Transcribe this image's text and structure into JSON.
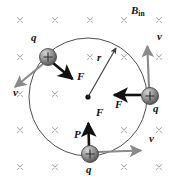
{
  "figure": {
    "type": "physics-diagram",
    "width": 173,
    "height": 186,
    "background_color": "#ffffff"
  },
  "field": {
    "label": "B",
    "subscript": "in",
    "label_position": {
      "x": 131,
      "y": 7
    },
    "symbol": "cross-into-page",
    "symbol_color": "#a8a8a8",
    "grid": {
      "columns_x": [
        20,
        55,
        90,
        124,
        159
      ],
      "rows_y": [
        20,
        57,
        94,
        130,
        167
      ],
      "mark_size": 5,
      "hidden_marks": [
        [
          90,
          57
        ],
        [
          90,
          94
        ],
        [
          90,
          167
        ],
        [
          159,
          94
        ]
      ]
    }
  },
  "orbit": {
    "center": {
      "x": 88,
      "y": 97
    },
    "radius": 59,
    "stroke_color": "#3a3a3a",
    "stroke_width": 0.9,
    "center_dot_radius": 2.6,
    "center_dot_color": "#111111"
  },
  "radius_arrow": {
    "label": "r",
    "label_position": {
      "x": 97,
      "y": 57
    },
    "from": {
      "x": 88,
      "y": 97
    },
    "to": {
      "x": 117,
      "y": 47
    },
    "color": "#3a3a3a"
  },
  "particles": [
    {
      "id": "particle-top-left",
      "charge_label": "q",
      "charge_label_position": {
        "x": 31,
        "y": 38
      },
      "sign": "+",
      "position": {
        "x": 48,
        "y": 57
      },
      "radius": 8.5,
      "velocity": {
        "label": "v",
        "label_position": {
          "x": 13,
          "y": 92
        },
        "from": {
          "x": 43,
          "y": 64
        },
        "to": {
          "x": 13,
          "y": 89
        },
        "color": "#8a8a8a"
      },
      "force": {
        "label": "F",
        "label_position": {
          "x": 77,
          "y": 76
        },
        "from": {
          "x": 53,
          "y": 63
        },
        "to": {
          "x": 74,
          "y": 80
        },
        "color": "#111111"
      }
    },
    {
      "id": "particle-right",
      "charge_label": "q",
      "charge_label_position": {
        "x": 153,
        "y": 108
      },
      "sign": "+",
      "position": {
        "x": 150,
        "y": 96
      },
      "radius": 8.5,
      "velocity": {
        "label": "v",
        "label_position": {
          "x": 157,
          "y": 36
        },
        "from": {
          "x": 149,
          "y": 88
        },
        "to": {
          "x": 147,
          "y": 44
        },
        "color": "#8a8a8a"
      },
      "force": {
        "label": "F",
        "label_position": {
          "x": 115,
          "y": 104
        },
        "from": {
          "x": 141,
          "y": 95
        },
        "to": {
          "x": 112,
          "y": 95
        },
        "color": "#111111"
      }
    },
    {
      "id": "particle-bottom",
      "charge_label": "q",
      "charge_label_position": {
        "x": 86,
        "y": 168
      },
      "point_label": "P",
      "point_label_position": {
        "x": 75,
        "y": 134
      },
      "sign": "+",
      "position": {
        "x": 90,
        "y": 154
      },
      "radius": 8.5,
      "velocity": {
        "label": "v",
        "label_position": {
          "x": 149,
          "y": 138
        },
        "from": {
          "x": 98,
          "y": 152
        },
        "to": {
          "x": 143,
          "y": 150
        },
        "color": "#8a8a8a"
      },
      "force": {
        "label": "F",
        "label_position": {
          "x": 96,
          "y": 112
        },
        "from": {
          "x": 89,
          "y": 146
        },
        "to": {
          "x": 88,
          "y": 121
        },
        "color": "#111111"
      }
    }
  ],
  "colors": {
    "particle_fill_light": "#bdbdbd",
    "particle_fill_dark": "#5d5d5d",
    "particle_edge": "#3a3a3a",
    "force_arrow": "#111111",
    "velocity_arrow": "#8a8a8a",
    "field_cross": "#a8a8a8",
    "orbit_line": "#3a3a3a"
  }
}
